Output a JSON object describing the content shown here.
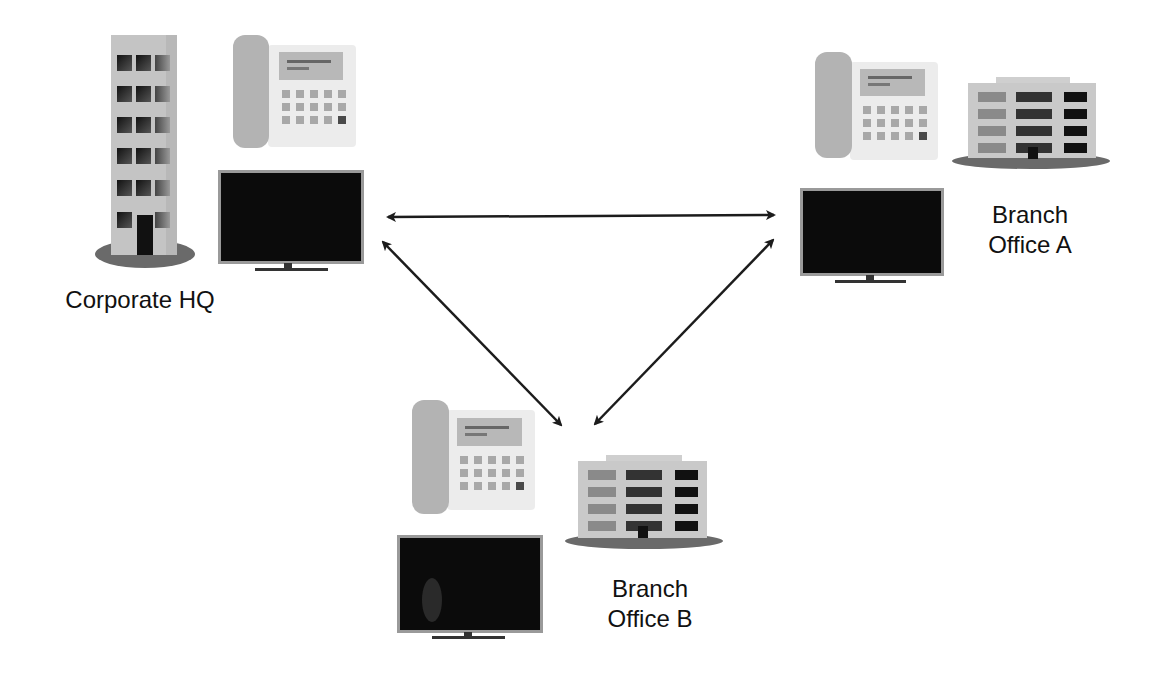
{
  "diagram": {
    "type": "network-topology",
    "colors": {
      "background": "#ffffff",
      "building_wall": "#c4c4c4",
      "building_shade": "#b0b0b0",
      "window_dark": "#1a1a1a",
      "window_mid": "#555555",
      "window_light": "#8a8a8a",
      "base_ellipse": "#6a6a6a",
      "phone_handset": "#b3b3b3",
      "phone_body": "#ececec",
      "phone_display": "#b8b8b8",
      "phone_key": "#a8a8a8",
      "phone_key_dark": "#4a4a4a",
      "monitor_screen": "#0b0b0b",
      "monitor_bezel": "#9a9a9a",
      "arrow": "#1c1c1c",
      "label_text": "#111111"
    },
    "nodes": [
      {
        "id": "hq",
        "label_line1": "Corporate HQ",
        "label_line2": "",
        "building": "tower",
        "devices": [
          "desk-phone",
          "video-monitor"
        ]
      },
      {
        "id": "branch_a",
        "label_line1": "Branch",
        "label_line2": "Office A",
        "building": "low-rise",
        "devices": [
          "desk-phone",
          "video-monitor"
        ]
      },
      {
        "id": "branch_b",
        "label_line1": "Branch",
        "label_line2": "Office B",
        "building": "low-rise",
        "devices": [
          "desk-phone",
          "video-monitor"
        ]
      }
    ],
    "edges": [
      {
        "from": "hq",
        "to": "branch_a",
        "direction": "bidirectional"
      },
      {
        "from": "hq",
        "to": "branch_b",
        "direction": "bidirectional"
      },
      {
        "from": "branch_a",
        "to": "branch_b",
        "direction": "bidirectional"
      }
    ]
  }
}
